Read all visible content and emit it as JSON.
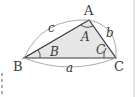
{
  "diagram": {
    "type": "triangle",
    "fill_color": "#e6e6e6",
    "stroke_color": "#3a3a3a",
    "arc_color": "#a0a0a0",
    "vertices": [
      {
        "label": "A",
        "x": 89,
        "y": 20
      },
      {
        "label": "B",
        "x": 24,
        "y": 58
      },
      {
        "label": "C",
        "x": 116,
        "y": 58
      }
    ],
    "sides": [
      {
        "label": "a",
        "between": "B-C"
      },
      {
        "label": "b",
        "between": "A-C"
      },
      {
        "label": "c",
        "between": "A-B"
      }
    ],
    "angles": [
      {
        "label": "A",
        "at": "A"
      },
      {
        "label": "B",
        "at": "B"
      },
      {
        "label": "C",
        "at": "C"
      }
    ]
  }
}
